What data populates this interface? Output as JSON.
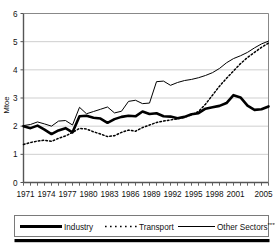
{
  "chart_data": {
    "type": "line",
    "title": "",
    "xlabel": "",
    "ylabel": "Mtoe",
    "ylim": [
      0,
      6
    ],
    "yticks": [
      0,
      1,
      2,
      3,
      4,
      5,
      6
    ],
    "ytick_labels": [
      "0",
      "1",
      "2",
      "3",
      "4",
      "5",
      "6"
    ],
    "grid": true,
    "grid_axis": "y",
    "legend_position": "bottom",
    "xlim": [
      1971,
      2006
    ],
    "x": [
      1971,
      1972,
      1973,
      1974,
      1975,
      1976,
      1977,
      1978,
      1979,
      1980,
      1981,
      1982,
      1983,
      1984,
      1985,
      1986,
      1987,
      1988,
      1989,
      1990,
      1991,
      1992,
      1993,
      1994,
      1995,
      1996,
      1997,
      1998,
      1999,
      2000,
      2001,
      2002,
      2003,
      2004,
      2005,
      2006
    ],
    "xtick_labels": [
      "1971",
      "1974",
      "1977",
      "1980",
      "1983",
      "1986",
      "1989",
      "1992",
      "1995",
      "1998",
      "2001",
      "2005"
    ],
    "xtick_values": [
      1971,
      1974,
      1977,
      1980,
      1983,
      1986,
      1989,
      1992,
      1995,
      1998,
      2001,
      2005
    ],
    "series": [
      {
        "name": "Industry",
        "style": "solid-thick",
        "color": "#000000",
        "values": [
          2.0,
          1.93,
          2.02,
          1.88,
          1.72,
          1.85,
          1.93,
          1.78,
          2.35,
          2.37,
          2.3,
          2.27,
          2.12,
          2.25,
          2.33,
          2.37,
          2.35,
          2.52,
          2.43,
          2.46,
          2.35,
          2.34,
          2.28,
          2.33,
          2.42,
          2.46,
          2.62,
          2.67,
          2.72,
          2.82,
          3.1,
          3.02,
          2.73,
          2.58,
          2.6,
          2.7
        ]
      },
      {
        "name": "Transport",
        "style": "dotted",
        "color": "#000000",
        "values": [
          1.35,
          1.42,
          1.47,
          1.5,
          1.46,
          1.57,
          1.65,
          1.78,
          1.92,
          1.9,
          1.8,
          1.72,
          1.63,
          1.66,
          1.78,
          1.86,
          1.82,
          1.95,
          2.04,
          2.13,
          2.18,
          2.22,
          2.26,
          2.32,
          2.4,
          2.52,
          2.78,
          3.1,
          3.42,
          3.7,
          3.96,
          4.22,
          4.44,
          4.62,
          4.8,
          4.95
        ]
      },
      {
        "name": "Other Sectors****",
        "style": "solid-thin",
        "color": "#000000",
        "values": [
          2.02,
          2.06,
          2.15,
          2.08,
          2.0,
          2.18,
          2.2,
          2.04,
          2.67,
          2.44,
          2.52,
          2.6,
          2.68,
          2.47,
          2.53,
          2.88,
          2.92,
          2.8,
          2.82,
          3.58,
          3.6,
          3.45,
          3.55,
          3.62,
          3.66,
          3.72,
          3.8,
          3.9,
          4.05,
          4.25,
          4.4,
          4.5,
          4.62,
          4.78,
          4.92,
          5.02
        ]
      }
    ]
  },
  "legend": {
    "items": [
      {
        "label": "Industry",
        "style": "solid-thick"
      },
      {
        "label": "Transport",
        "style": "dotted"
      },
      {
        "label": "Other Sectors",
        "sup": "****",
        "style": "solid-thin"
      }
    ]
  }
}
